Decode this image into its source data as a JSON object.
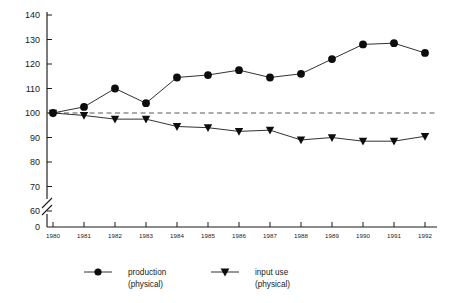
{
  "chart_data": {
    "type": "line",
    "title": "",
    "subtitle": "",
    "xlabel": "",
    "ylabel": "",
    "categories": [
      "1980",
      "1981",
      "1982",
      "1983",
      "1984",
      "1985",
      "1986",
      "1987",
      "1988",
      "1989",
      "1990",
      "1991",
      "1992"
    ],
    "x": [
      1980,
      1981,
      1982,
      1983,
      1984,
      1985,
      1986,
      1987,
      1988,
      1989,
      1990,
      1991,
      1992
    ],
    "series": [
      {
        "name": "production (physical)",
        "marker": "filled-circle",
        "values": [
          100,
          102.5,
          110,
          104,
          114.5,
          115.5,
          117.5,
          114.5,
          116,
          122,
          128,
          128.5,
          124.5
        ]
      },
      {
        "name": "input use (physical)",
        "marker": "filled-triangle-down",
        "values": [
          100,
          99,
          97.5,
          97.5,
          94.5,
          94,
          92.5,
          93,
          89,
          90,
          88.5,
          88.5,
          90.5
        ]
      }
    ],
    "reference_line": {
      "value": 100,
      "style": "dashed"
    },
    "ylim": [
      60,
      140
    ],
    "yticks": [
      60,
      70,
      80,
      90,
      100,
      110,
      120,
      130,
      140
    ],
    "ytick_labels": [
      "60",
      "70",
      "80",
      "90",
      "100",
      "110",
      "120",
      "130",
      "140"
    ],
    "y_zero_label": "0",
    "y_axis_break": true,
    "xtick_labels": [
      "1980",
      "1981",
      "1982",
      "1983",
      "1984",
      "1985",
      "1986",
      "1987",
      "1988",
      "1989",
      "1990",
      "1991",
      "1992"
    ],
    "grid": false,
    "legend_position": "bottom",
    "colors": {
      "axis": "#1a1a1a",
      "series": "#0d0d0d",
      "reference": "#55585c",
      "background": "#ffffff"
    }
  },
  "legend": {
    "entries": [
      {
        "label_line1": "production",
        "label_line2": "(physical)",
        "marker": "filled-circle"
      },
      {
        "label_line1": "input use",
        "label_line2": "(physical)",
        "marker": "filled-triangle-down"
      }
    ]
  }
}
